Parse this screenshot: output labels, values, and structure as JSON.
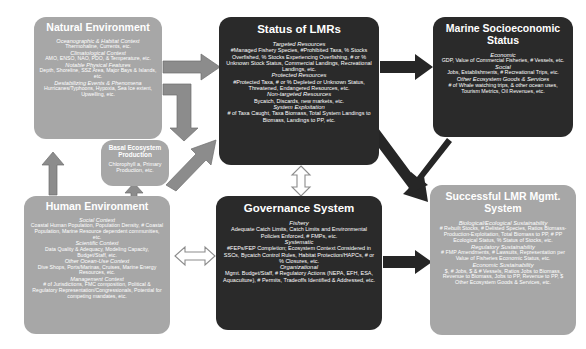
{
  "diagram": {
    "boxes": {
      "natural_environment": {
        "title": "Natural Environment",
        "groups": [
          {
            "header": "Oceanographic & Habitat Context",
            "detail": "Thermohaline, Currents, etc."
          },
          {
            "header": "Climatological Context",
            "detail": "AMO, ENSO, NAO, PDO, & Temperature, etc."
          },
          {
            "header": "Notable Physical Features",
            "detail": "Depth, Shoreline, SSZ Area, Major Bays & Islands, etc."
          },
          {
            "header": "Destabilizing Events & Phenomena",
            "detail": "Hurricanes/Typhoons, Hypoxia, Sea Ice extent, Upwelling, etc."
          }
        ]
      },
      "basal_ecosystem_production": {
        "title": "Basal Ecosystem Production",
        "groups": [
          {
            "header": "",
            "detail": "Chlorophyll a, Primary Production, etc."
          }
        ]
      },
      "human_environment": {
        "title": "Human Environment",
        "groups": [
          {
            "header": "Social Context",
            "detail": "Coastal Human Population, Population Density, # Coastal Population, Marine Resource dependent communities, etc."
          },
          {
            "header": "Scientific Context",
            "detail": "Data Quality & Adequacy, Modeling Capacity, Budget/Staff, etc."
          },
          {
            "header": "Other Ocean-Use Context",
            "detail": "Dive Shops, Ports/Marinas, Cruises, Marine Energy Resources, etc."
          },
          {
            "header": "Management Context",
            "detail": "# of Jurisdictions, FMC composition, Political & Regulatory Representation/Congressionals, Potential for competing mandates, etc."
          }
        ]
      },
      "status_of_lmrs": {
        "title": "Status of LMRs",
        "groups": [
          {
            "header": "Targeted Resources",
            "detail": "#Managed Fishery Species, #Prohibited Taxa, % Stocks Overfished, % Stocks Experiencing Overfishing, # or % Unknown Stock Status, Commercial Landings, Recreational Landings, etc."
          },
          {
            "header": "Protected Resources",
            "detail": "#Protected Taxa, # or % Depleted or Unknown Status, Threatened, Endangered Resources, etc."
          },
          {
            "header": "Non-targeted Resources",
            "detail": "Bycatch, Discards, new markets, etc."
          },
          {
            "header": "System Exploitation",
            "detail": "# of Taxa Caught, Taxa Biomass, Total System Landings to Biomass, Landings to PP, etc."
          }
        ]
      },
      "governance_system": {
        "title": "Governance System",
        "groups": [
          {
            "header": "Fishery",
            "detail": "Adequate Catch Limits, Catch Limits and Environmental Policies Enforced, # FMPs, etc."
          },
          {
            "header": "Systematic",
            "detail": "#FEPs/FEP Completion; Ecosystem Context Considered in SSCs, Bycatch Control Rules, Habitat Protection/HAPCs, # or % Closures, etc."
          },
          {
            "header": "Organizational",
            "detail": "Mgmt. Budget/Staff, # Regulatory Actions (NEPA, EFH, ESA, Aquaculture), # Permits, Tradeoffs Identified & Addressed, etc."
          }
        ]
      },
      "marine_socioeconomic_status": {
        "title": "Marine Socioeconomic Status",
        "groups": [
          {
            "header": "Economic",
            "detail": "GDP, Value of Commercial Fisheries, # Vessels, etc."
          },
          {
            "header": "Social",
            "detail": "Jobs, Establishments, # Recreational Trips, etc."
          },
          {
            "header": "Other Ecosystem Goods & Services",
            "detail": "# of Whale watching trips, & other ocean uses, Tourism Metrics, Oil Revenues, etc."
          }
        ]
      },
      "successful_lmr_mgmt_system": {
        "title": "Successful LMR Mgmt. System",
        "groups": [
          {
            "header": "Biological/Ecological Sustainability",
            "detail": "# Rebuilt Stocks, # Delisted Species, Ratios Biomass-Production-Exploitation, Total Biomass to PP, # PP Ecological Status, % Status of Stocks, etc."
          },
          {
            "header": "Regulatory Sustainability",
            "detail": "# FMP Amendments, # Lawsuits, Representation per Value of Fisheries Economic Status, etc."
          },
          {
            "header": "Economic Sustainability",
            "detail": "$, # Jobs, $ & # Vessels, Ratios Jobs to Biomass, Revenue to Biomass, Jobs to PP, Revenue to PP, $ Other Ecosystem Goods & Services, etc."
          }
        ]
      }
    },
    "arrows": [
      {
        "name": "natural-environment-to-status-of-lmrs",
        "style": "gray"
      },
      {
        "name": "natural-environment-to-basal-ecosystem-production",
        "style": "gray"
      },
      {
        "name": "basal-ecosystem-production-to-status-of-lmrs",
        "style": "gray"
      },
      {
        "name": "human-environment-to-basal-ecosystem-production",
        "style": "gray"
      },
      {
        "name": "natural-environment-to-human-environment",
        "style": "gray"
      },
      {
        "name": "status-of-lmrs-to-marine-socioeconomic-status",
        "style": "gray"
      },
      {
        "name": "status-of-lmrs-to-successful-lmr-mgmt-system",
        "style": "dark"
      },
      {
        "name": "marine-socioeconomic-status-to-successful-lmr-mgmt-system",
        "style": "dark"
      },
      {
        "name": "human-environment-to-governance-system",
        "style": "outline"
      },
      {
        "name": "status-of-lmrs-to-governance-system",
        "style": "outline"
      },
      {
        "name": "governance-system-to-successful-lmr-mgmt-system",
        "style": "dark"
      }
    ],
    "colors": {
      "gray_box": "#a7a7a7",
      "dark_box": "#2a2a2a",
      "gray_arrow": "#8c8c8c",
      "dark_arrow": "#262626",
      "outline_arrow_fill": "#ffffff",
      "outline_arrow_stroke": "#8c8c8c",
      "text": "#ffffff",
      "background": "#ffffff"
    }
  }
}
